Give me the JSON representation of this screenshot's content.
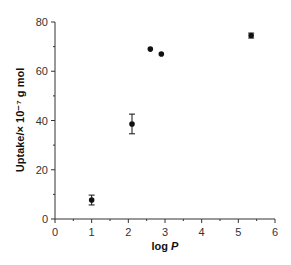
{
  "chart_data": {
    "type": "scatter",
    "title": "",
    "xlabel": "log P",
    "xlabel_plain": "log ",
    "xlabel_italic": "P",
    "ylabel": "Uptake/× 10⁻⁷ g mol",
    "xlim": [
      0,
      6
    ],
    "ylim": [
      0,
      80
    ],
    "x_ticks": [
      0,
      1,
      2,
      3,
      4,
      5,
      6
    ],
    "y_ticks": [
      0,
      20,
      40,
      60,
      80
    ],
    "grid": false,
    "legend": null,
    "series": [
      {
        "name": "Uptake",
        "x": [
          1.0,
          2.1,
          2.6,
          2.9,
          5.35
        ],
        "y": [
          7.7,
          38.6,
          69.0,
          67.0,
          74.5
        ],
        "yerr": [
          2.0,
          4.0,
          0,
          0,
          1.0
        ],
        "marker": "filled-circle",
        "color": "#111111"
      }
    ]
  }
}
